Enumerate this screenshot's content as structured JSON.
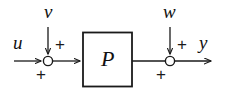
{
  "figure": {
    "kind": "block-diagram",
    "background_color": "#ffffff",
    "line_color": "#1a1a1a"
  },
  "blocks": [
    {
      "id": "plant",
      "label": "P",
      "shape": "rectangle"
    }
  ],
  "signals": {
    "input": "u",
    "input_disturbance": "v",
    "output_disturbance": "w",
    "output": "y"
  },
  "summing_junctions": [
    {
      "id": "junction-left",
      "shape": "circle",
      "signs": {
        "horizontal_in": "+",
        "vertical_in": "+"
      }
    },
    {
      "id": "junction-right",
      "shape": "circle",
      "signs": {
        "horizontal_in": "+",
        "vertical_in": "+"
      }
    }
  ],
  "labels": {
    "u": "u",
    "v": "v",
    "w": "w",
    "y": "y",
    "P": "P",
    "plus_v": "+",
    "plus_u": "+",
    "plus_w": "+",
    "plus_p": "+"
  }
}
